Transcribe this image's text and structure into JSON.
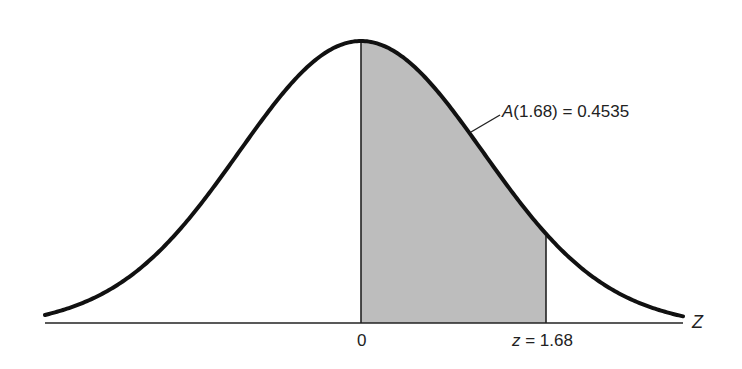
{
  "diagram": {
    "title": "",
    "area_label_fn": "A",
    "area_label_arg": "(1.68)",
    "area_label_eq": " = 0.4535",
    "axis_label": "Z",
    "tick_zero": "0",
    "tick_z_var": "z",
    "tick_z_eq": " = 1.68",
    "colors": {
      "curve": "#111111",
      "shade": "#bdbdbd",
      "axis": "#222222",
      "text": "#222222",
      "background": "#ffffff"
    }
  },
  "chart_data": {
    "type": "area",
    "title": "",
    "xlabel": "Z",
    "ylabel": "",
    "curve": "standard normal density",
    "shaded_region": {
      "from": 0,
      "to": 1.68
    },
    "annotation": "A(1.68) = 0.4535",
    "x_ticks": [
      {
        "value": 0,
        "label": "0"
      },
      {
        "value": 1.68,
        "label": "z = 1.68"
      }
    ],
    "area_value": 0.4535,
    "grid": false,
    "legend": "none"
  }
}
